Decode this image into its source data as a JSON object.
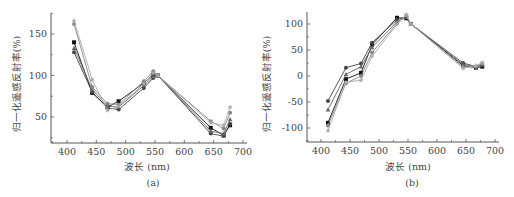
{
  "chart_data": [
    {
      "panel": "(a)",
      "type": "line",
      "xlabel": "波长 (nm)",
      "ylabel": "归一化遥感反射率(%)",
      "xlim": [
        375,
        705
      ],
      "ylim": [
        20,
        175
      ],
      "xticks": [
        400,
        450,
        500,
        550,
        600,
        650,
        700
      ],
      "yticks": [
        50,
        100,
        150
      ],
      "grid": false,
      "legend": "none",
      "x": [
        412,
        443,
        469,
        488,
        531,
        547,
        555,
        645,
        667,
        678
      ],
      "series": [
        {
          "name": "s1",
          "color": "#111111",
          "marker": "square",
          "values": [
            140,
            79,
            62,
            69,
            91,
            101,
            100,
            37,
            28,
            40
          ]
        },
        {
          "name": "s2",
          "color": "#444444",
          "marker": "circle",
          "values": [
            128,
            80,
            61,
            59,
            85,
            97,
            100,
            30,
            27,
            42
          ]
        },
        {
          "name": "s3",
          "color": "#666666",
          "marker": "triangle-up",
          "values": [
            133,
            83,
            63,
            62,
            88,
            99,
            100,
            33,
            30,
            47
          ]
        },
        {
          "name": "s4",
          "color": "#888888",
          "marker": "circle",
          "values": [
            162,
            86,
            66,
            65,
            93,
            105,
            100,
            45,
            36,
            55
          ]
        },
        {
          "name": "s5",
          "color": "#aaaaaa",
          "marker": "star",
          "values": [
            166,
            95,
            58,
            63,
            90,
            103,
            100,
            43,
            40,
            62
          ]
        }
      ]
    },
    {
      "panel": "(b)",
      "type": "line",
      "xlabel": "波长 (nm)",
      "ylabel": "归一化遥感反射率(%)",
      "xlim": [
        375,
        705
      ],
      "ylim": [
        -125,
        125
      ],
      "xticks": [
        400,
        450,
        500,
        550,
        600,
        650,
        700
      ],
      "yticks": [
        -100,
        -50,
        0,
        50,
        100
      ],
      "grid": false,
      "legend": "none",
      "x": [
        412,
        443,
        469,
        488,
        531,
        547,
        555,
        645,
        667,
        678
      ],
      "series": [
        {
          "name": "s1",
          "color": "#111111",
          "marker": "square",
          "values": [
            -90,
            -6,
            6,
            60,
            112,
            111,
            100,
            20,
            16,
            18
          ]
        },
        {
          "name": "s2",
          "color": "#444444",
          "marker": "circle",
          "values": [
            -48,
            16,
            24,
            64,
            108,
            114,
            100,
            25,
            18,
            20
          ]
        },
        {
          "name": "s3",
          "color": "#666666",
          "marker": "triangle-up",
          "values": [
            -65,
            3,
            18,
            55,
            104,
            113,
            100,
            22,
            19,
            22
          ]
        },
        {
          "name": "s4",
          "color": "#888888",
          "marker": "circle",
          "values": [
            -95,
            -14,
            0,
            45,
            101,
            117,
            100,
            17,
            18,
            24
          ]
        },
        {
          "name": "s5",
          "color": "#aaaaaa",
          "marker": "star",
          "values": [
            -105,
            -12,
            -8,
            38,
            99,
            118,
            100,
            15,
            20,
            26
          ]
        }
      ]
    }
  ],
  "panels": [
    {
      "label": "(a)",
      "xlabel": "波长 (nm)",
      "ylabel": "归一化遥感反射率(%)"
    },
    {
      "label": "(b)",
      "xlabel": "波长 (nm)",
      "ylabel": "归一化遥感反射率(%)"
    }
  ]
}
